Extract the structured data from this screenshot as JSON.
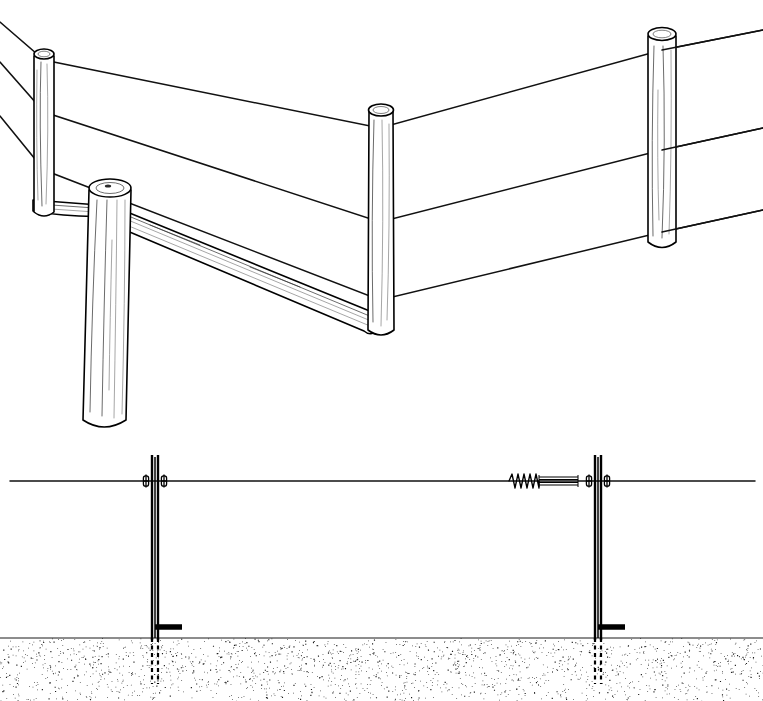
{
  "figure": {
    "title": "Barbed wire fence construction details",
    "width": 763,
    "height": 701,
    "background_color": "#ffffff",
    "ink_color": "#000000",
    "style": "black-and-white line drawing",
    "panel_count": 2
  },
  "panels": [
    {
      "id": "upper-panel",
      "name": "brace-assembly-perspective",
      "caption": "Perspective view of wooden corner brace assembly with barbed wire",
      "view": "perspective",
      "region": {
        "x": 0,
        "y": 0,
        "width": 763,
        "height": 430
      }
    },
    {
      "id": "lower-panel",
      "name": "t-post-elevation-section",
      "caption": "Side elevation of two steel T-posts with wire clips, in-line spring tensioner and buried post section",
      "view": "elevation-section",
      "region": {
        "x": 0,
        "y": 430,
        "width": 763,
        "height": 271
      }
    }
  ],
  "upper": {
    "wood_posts": [
      {
        "name": "anchor-post",
        "label": "Anchor post",
        "role": "anchor",
        "top_x": 44,
        "top_y": 48,
        "bottom_x": 52,
        "bottom_y": 222,
        "radius_top": 10,
        "radius_bottom": 11
      },
      {
        "name": "corner-post",
        "label": "Corner post",
        "role": "corner-brace-post",
        "top_x": 110,
        "top_y": 185,
        "bottom_x": 104,
        "bottom_y": 426,
        "radius_top": 21,
        "radius_bottom": 22
      },
      {
        "name": "line-post-middle",
        "label": "Line post",
        "role": "line",
        "top_x": 380,
        "top_y": 105,
        "bottom_x": 382,
        "bottom_y": 340,
        "radius_top": 13,
        "radius_bottom": 13
      },
      {
        "name": "line-post-right",
        "label": "Line post",
        "role": "line",
        "top_x": 662,
        "top_y": 28,
        "bottom_x": 660,
        "bottom_y": 252,
        "radius_top": 14,
        "radius_bottom": 14
      }
    ],
    "braces": [
      {
        "name": "horizontal-brace",
        "label": "Horizontal brace rail",
        "from_x": 37,
        "from_y": 205,
        "to_x": 110,
        "to_y": 212,
        "thickness": 11
      },
      {
        "name": "diagonal-brace",
        "label": "Diagonal compression brace",
        "from_x": 112,
        "from_y": 213,
        "to_x": 382,
        "to_y": 322,
        "thickness": 14
      }
    ],
    "wires": [
      {
        "name": "barbed-wire-top",
        "label": "Top barbed wire strand",
        "points": "0,22 44,60 380,128 662,50 763,30",
        "barb_spacing": 26
      },
      {
        "name": "barbed-wire-middle",
        "label": "Middle barbed wire strand",
        "points": "0,62 44,112 380,222 662,150 763,128",
        "barb_spacing": 26
      },
      {
        "name": "barbed-wire-bottom",
        "label": "Bottom barbed wire strand",
        "points": "0,116 44,170 380,300 662,232 763,210",
        "barb_spacing": 26
      }
    ],
    "strand_count": 3,
    "barb_symbol": "x-cross"
  },
  "lower": {
    "ground_line_y": 638,
    "wire_line_y": 481,
    "soil": {
      "name": "soil-stipple",
      "label": "Soil / ground (stippled)",
      "top_y": 638,
      "bottom_y": 701,
      "pattern": "stipple",
      "dot_count": 5200
    },
    "fence_wire": {
      "name": "fence-wire-horizontal",
      "label": "Fence wire",
      "y": 481,
      "from_x": 10,
      "to_x": 755
    },
    "posts": [
      {
        "name": "t-post-left",
        "label": "Steel T-post",
        "x": 155,
        "top_y": 455,
        "ground_y": 638,
        "buried_bottom_y": 684,
        "web_width": 6,
        "anchor_plate": {
          "name": "anchor-plate",
          "label": "Soil anchor plate",
          "y": 627,
          "from_x": 155,
          "to_x": 182
        },
        "clips": [
          {
            "name": "wire-clip-left",
            "x": 146,
            "y": 481
          },
          {
            "name": "wire-clip-right",
            "x": 164,
            "y": 481
          }
        ]
      },
      {
        "name": "t-post-right",
        "label": "Steel T-post",
        "x": 598,
        "top_y": 455,
        "ground_y": 638,
        "buried_bottom_y": 684,
        "web_width": 6,
        "anchor_plate": {
          "name": "anchor-plate",
          "label": "Soil anchor plate",
          "y": 627,
          "from_x": 598,
          "to_x": 625
        },
        "clips": [
          {
            "name": "wire-clip-left",
            "x": 589,
            "y": 481
          },
          {
            "name": "wire-clip-right",
            "x": 607,
            "y": 481
          }
        ]
      }
    ],
    "tensioner": {
      "name": "in-line-spring-tensioner",
      "label": "In-line wire spring tensioner",
      "spring": {
        "name": "tension-spring",
        "from_x": 509,
        "to_x": 539,
        "y": 481,
        "coil_count": 5,
        "amplitude": 7
      },
      "barrel": {
        "name": "tensioner-barrel",
        "label": "Tensioner barrel / strainer body",
        "from_x": 539,
        "to_x": 578,
        "y": 481,
        "height": 12
      }
    }
  },
  "legend": {
    "items": [
      {
        "name": "wood-post",
        "label": "Wooden post"
      },
      {
        "name": "brace-rail",
        "label": "Brace rail"
      },
      {
        "name": "barbed-wire",
        "label": "Barbed wire"
      },
      {
        "name": "steel-t-post",
        "label": "Steel T-post"
      },
      {
        "name": "wire-clip",
        "label": "Wire clip"
      },
      {
        "name": "spring-tensioner",
        "label": "Spring tensioner"
      },
      {
        "name": "anchor-plate",
        "label": "Anchor plate"
      },
      {
        "name": "soil",
        "label": "Soil"
      }
    ]
  }
}
